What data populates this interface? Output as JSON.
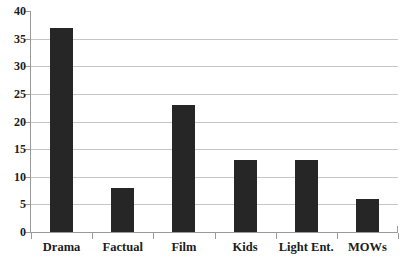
{
  "chart_data": {
    "type": "bar",
    "title": "",
    "subtitle": "",
    "xlabel": "",
    "ylabel": "",
    "categories": [
      "Drama",
      "Factual",
      "Film",
      "Kids",
      "Light Ent.",
      "MOWs"
    ],
    "values": [
      37,
      8,
      23,
      13,
      13,
      6
    ],
    "series": [
      {
        "name": "",
        "values": [
          37,
          8,
          23,
          13,
          13,
          6
        ]
      }
    ],
    "ylim": [
      0,
      40
    ],
    "yticks": [
      0,
      5,
      10,
      15,
      20,
      25,
      30,
      35,
      40
    ],
    "ytick_labels": [
      "0",
      "5",
      "10",
      "15",
      "20",
      "25",
      "30",
      "35",
      "40"
    ],
    "grid": true,
    "grid_axis": "y",
    "legend": false,
    "legend_position": "none",
    "annotations": [],
    "colors": {
      "bar": "#262626",
      "gridline": "#c6c6c6",
      "axis": "#9a9a9a",
      "text": "#1c1c1c",
      "background": "#ffffff"
    }
  }
}
